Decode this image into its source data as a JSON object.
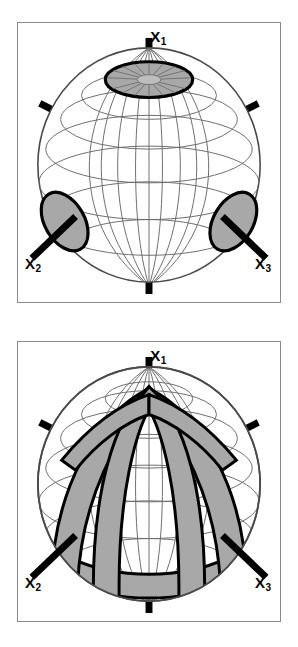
{
  "figure": {
    "panel_count": 2,
    "background_color": "#ffffff",
    "frame_color": "#8a8a8a"
  },
  "colors": {
    "shade_fill": "#a8a8a8",
    "shade_outline": "#000000",
    "graticule": "#6e6e6e",
    "sphere_outline": "#4a4a4a",
    "axis_stub": "#000000",
    "label": "#000000"
  },
  "axes": {
    "x1": {
      "base": "X",
      "subscript": "1",
      "label": "X1",
      "direction": "vertical-up",
      "position": "north-pole"
    },
    "x2": {
      "base": "X",
      "subscript": "2",
      "label": "X2",
      "direction": "lower-left",
      "position": "left-equator"
    },
    "x3": {
      "base": "X",
      "subscript": "3",
      "label": "X3",
      "direction": "lower-right",
      "position": "right-equator"
    }
  },
  "panels": [
    {
      "id": "panel-top",
      "name": "point-maxima-pattern",
      "description": "Sphere with isolated shaded elliptical patches centred on each principal axis",
      "sphere": {
        "cx": 132,
        "cy": 142,
        "rx": 112,
        "ry": 118
      },
      "graticule": {
        "meridians": 12,
        "parallels": 7,
        "visible": true
      },
      "shaded_regions": [
        {
          "name": "polar-cap-x1",
          "center_axis": "x1",
          "cx": 132,
          "cy": 56,
          "rx": 44,
          "ry": 18,
          "rotation": 0
        },
        {
          "name": "patch-x2",
          "center_axis": "x2",
          "cx": 47,
          "cy": 199,
          "rx": 20,
          "ry": 31,
          "rotation": -32
        },
        {
          "name": "patch-x3",
          "center_axis": "x3",
          "cx": 217,
          "cy": 199,
          "rx": 20,
          "ry": 31,
          "rotation": 32
        }
      ],
      "axis_stubs": [
        {
          "name": "stub-x1-top",
          "kind": "pole-up"
        },
        {
          "name": "stub-x1-bottom",
          "kind": "pole-down"
        },
        {
          "name": "stub-x2",
          "kind": "lower-left"
        },
        {
          "name": "stub-x3",
          "kind": "lower-right"
        },
        {
          "name": "stub-upper-left",
          "kind": "upper-left"
        },
        {
          "name": "stub-upper-right",
          "kind": "upper-right"
        }
      ]
    },
    {
      "id": "panel-bottom",
      "name": "girdle-band-pattern",
      "description": "Sphere with shaded great-circle girdle bands through the poles and around the equator",
      "sphere": {
        "cx": 132,
        "cy": 142,
        "rx": 112,
        "ry": 118
      },
      "graticule": {
        "meridians": 12,
        "parallels": 7,
        "visible": true
      },
      "shaded_bands": [
        {
          "name": "girdle-equatorial",
          "type": "small-circle-band",
          "orientation": "horizontal"
        },
        {
          "name": "girdle-meridian-left",
          "type": "great-circle-band",
          "orientation": "through-poles"
        },
        {
          "name": "girdle-meridian-right",
          "type": "great-circle-band",
          "orientation": "through-poles"
        },
        {
          "name": "girdle-oblique-left",
          "type": "great-circle-band",
          "orientation": "oblique"
        },
        {
          "name": "girdle-oblique-right",
          "type": "great-circle-band",
          "orientation": "oblique"
        }
      ],
      "axis_stubs": [
        {
          "name": "stub-x1-top",
          "kind": "pole-up"
        },
        {
          "name": "stub-x1-bottom",
          "kind": "pole-down"
        },
        {
          "name": "stub-x2",
          "kind": "lower-left"
        },
        {
          "name": "stub-x3",
          "kind": "lower-right"
        },
        {
          "name": "stub-upper-left",
          "kind": "upper-left"
        },
        {
          "name": "stub-upper-right",
          "kind": "upper-right"
        }
      ]
    }
  ]
}
